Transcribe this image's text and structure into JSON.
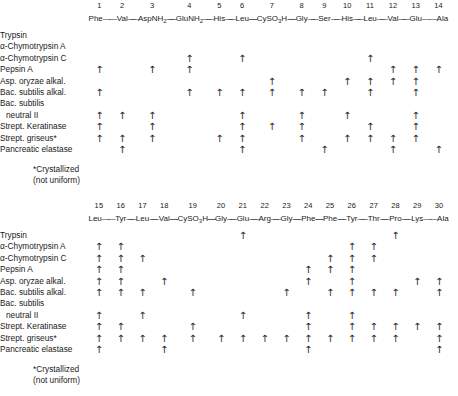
{
  "figure": {
    "footnote_line1": "*Crystallized",
    "footnote_line2": "(not uniform)",
    "arrow_glyph": "↑",
    "dash_glyph": "—",
    "text_color": "#1a1a1a",
    "arrow_color": "#2a2a2a",
    "background": "#ffffff"
  },
  "enzymes": [
    "Trypsin",
    "α-Chymotrypsin A",
    "α-Chymotrypsin C",
    "Pepsin A",
    "Asp. oryzae alkal.",
    "Bac. subtilis alkal.",
    "Bac. subtilis",
    "neutral II",
    "Strept. Keratinase",
    "Strept. griseus*",
    "Pancreatic elastase"
  ],
  "panels": [
    {
      "id": "panel-top",
      "numbers": [
        "1",
        "2",
        "3",
        "4",
        "5",
        "6",
        "7",
        "8",
        "9",
        "10",
        "11",
        "12",
        "13",
        "14"
      ],
      "residues": [
        {
          "main": "Phe",
          "sub": ""
        },
        {
          "main": "Val",
          "sub": ""
        },
        {
          "main": "AspNH",
          "sub": "2"
        },
        {
          "main": "GluNH",
          "sub": "2"
        },
        {
          "main": "His",
          "sub": ""
        },
        {
          "main": "Leu",
          "sub": ""
        },
        {
          "main": "CySO",
          "sub": "3",
          "tail": "H"
        },
        {
          "main": "Gly",
          "sub": ""
        },
        {
          "main": "Ser",
          "sub": ""
        },
        {
          "main": "His",
          "sub": ""
        },
        {
          "main": "Leu",
          "sub": ""
        },
        {
          "main": "Val",
          "sub": ""
        },
        {
          "main": "Glu",
          "sub": ""
        },
        {
          "main": "Ala",
          "sub": ""
        }
      ],
      "cleavages": [
        {
          "enzyme": "Trypsin",
          "sites": []
        },
        {
          "enzyme": "α-Chymotrypsin A",
          "sites": []
        },
        {
          "enzyme": "α-Chymotrypsin C",
          "sites": [
            4,
            6,
            11
          ]
        },
        {
          "enzyme": "Pepsin A",
          "sites": [
            1,
            3,
            4,
            12,
            13,
            14
          ]
        },
        {
          "enzyme": "Asp. oryzae alkal.",
          "sites": [
            7,
            10,
            11,
            12,
            13
          ]
        },
        {
          "enzyme": "Bac. subtilis alkal.",
          "sites": [
            1,
            4,
            5,
            6,
            7,
            8,
            9,
            11,
            13
          ]
        },
        {
          "enzyme": "Bac. subtilis",
          "sites": []
        },
        {
          "enzyme": "neutral II",
          "sites": [
            1,
            2,
            3,
            6,
            8,
            10,
            13
          ]
        },
        {
          "enzyme": "Strept. Keratinase",
          "sites": [
            1,
            3,
            6,
            7,
            8,
            11,
            13
          ]
        },
        {
          "enzyme": "Strept. griseus*",
          "sites": [
            1,
            2,
            3,
            5,
            6,
            8,
            10,
            11,
            12,
            13
          ]
        },
        {
          "enzyme": "Pancreatic elastase",
          "sites": [
            2,
            6,
            9,
            12,
            14
          ]
        }
      ]
    },
    {
      "id": "panel-bot",
      "numbers": [
        "15",
        "16",
        "17",
        "18",
        "19",
        "20",
        "21",
        "22",
        "23",
        "24",
        "25",
        "26",
        "27",
        "28",
        "29",
        "30"
      ],
      "residues": [
        {
          "main": "Leu",
          "sub": ""
        },
        {
          "main": "Tyr",
          "sub": ""
        },
        {
          "main": "Leu",
          "sub": ""
        },
        {
          "main": "Val",
          "sub": ""
        },
        {
          "main": "CySO",
          "sub": "3",
          "tail": "H"
        },
        {
          "main": "Gly",
          "sub": ""
        },
        {
          "main": "Glu",
          "sub": ""
        },
        {
          "main": "Arg",
          "sub": ""
        },
        {
          "main": "Gly",
          "sub": ""
        },
        {
          "main": "Phe",
          "sub": ""
        },
        {
          "main": "Phe",
          "sub": ""
        },
        {
          "main": "Tyr",
          "sub": ""
        },
        {
          "main": "Thr",
          "sub": ""
        },
        {
          "main": "Pro",
          "sub": ""
        },
        {
          "main": "Lys",
          "sub": ""
        },
        {
          "main": "Ala",
          "sub": ""
        }
      ],
      "cleavages": [
        {
          "enzyme": "Trypsin",
          "sites": [
            21,
            28
          ]
        },
        {
          "enzyme": "α-Chymotrypsin A",
          "sites": [
            15,
            16,
            26,
            27
          ]
        },
        {
          "enzyme": "α-Chymotrypsin C",
          "sites": [
            15,
            16,
            17,
            25,
            26,
            27
          ]
        },
        {
          "enzyme": "Pepsin A",
          "sites": [
            15,
            16,
            24,
            25,
            26
          ]
        },
        {
          "enzyme": "Asp. oryzae alkal.",
          "sites": [
            15,
            16,
            18,
            24,
            26,
            29,
            30
          ]
        },
        {
          "enzyme": "Bac. subtilis alkal.",
          "sites": [
            15,
            16,
            17,
            19,
            23,
            25,
            26,
            27,
            28,
            30
          ]
        },
        {
          "enzyme": "Bac. subtilis",
          "sites": []
        },
        {
          "enzyme": "neutral II",
          "sites": [
            15,
            17,
            21,
            24,
            26
          ]
        },
        {
          "enzyme": "Strept. Keratinase",
          "sites": [
            15,
            16,
            19,
            24,
            26,
            27,
            28,
            29,
            30
          ]
        },
        {
          "enzyme": "Strept. griseus*",
          "sites": [
            15,
            16,
            17,
            18,
            19,
            20,
            21,
            22,
            23,
            24,
            25,
            26,
            27,
            28,
            30
          ]
        },
        {
          "enzyme": "Pancreatic elastase",
          "sites": [
            15,
            18,
            24,
            30
          ]
        }
      ]
    }
  ]
}
